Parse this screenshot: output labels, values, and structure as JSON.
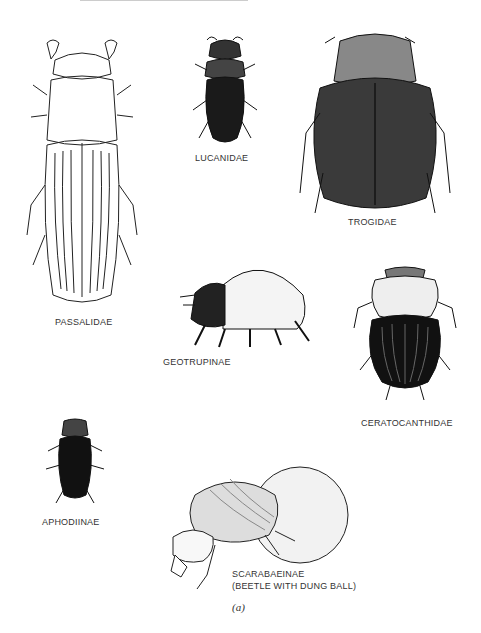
{
  "figure": {
    "caption": "(a)",
    "labels": {
      "passalidae": "PASSALIDAE",
      "lucanidae": "LUCANIDAE",
      "trogidae": "TROGIDAE",
      "geotrupinae": "GEOTRUPINAE",
      "ceratocanthidae": "CERATOCANTHIDAE",
      "aphodiinae": "APHODIINAE",
      "scarabaeinae_1": "SCARABAEINAE",
      "scarabaeinae_2": "(BEETLE WITH DUNG BALL)"
    }
  }
}
